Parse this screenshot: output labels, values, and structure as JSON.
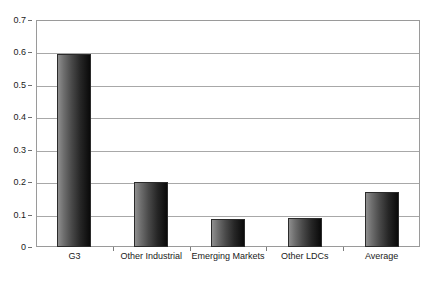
{
  "chart_data": {
    "type": "bar",
    "title": "",
    "subtitle": "",
    "xlabel": "",
    "ylabel": "",
    "categories": [
      "G3",
      "Other Industrial",
      "Emerging Markets",
      "Other LDCs",
      "Average"
    ],
    "values": [
      0.595,
      0.199,
      0.085,
      0.09,
      0.17
    ],
    "series": [
      {
        "name": "",
        "values": [
          0.595,
          0.199,
          0.085,
          0.09,
          0.17
        ]
      }
    ],
    "ylim": [
      0,
      0.7
    ],
    "ytick_values": [
      0,
      0.1,
      0.2,
      0.3,
      0.4,
      0.5,
      0.6,
      0.7
    ],
    "ytick_labels": [
      "0",
      "0.1",
      "0.2",
      "0.3",
      "0.4",
      "0.5",
      "0.6",
      "0.7"
    ],
    "grid": true,
    "grid_axis": "y",
    "legend": false,
    "legend_position": "none",
    "annotations": [],
    "colors": {
      "bar_fill_light": "#8e8e8e",
      "bar_fill_dark": "#0a0a0a",
      "bar_border": "#2b2b2b",
      "gridline": "#a8a8a8",
      "axis_border": "#9a9a9a",
      "text": "#1a1a1a",
      "background": "#ffffff"
    }
  }
}
